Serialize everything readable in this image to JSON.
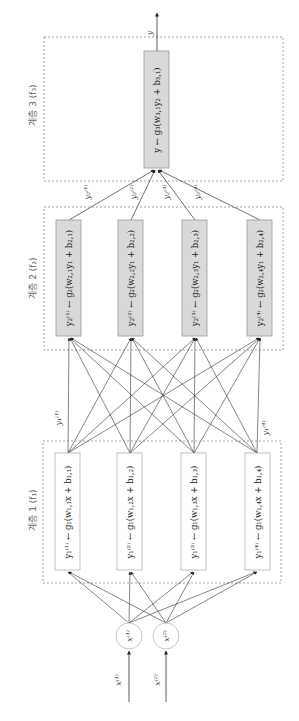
{
  "colors": {
    "background": "#ffffff",
    "layer_box_stroke": "#888888",
    "edge": "#333333",
    "layer1_node_fill": "#ffffff",
    "layer1_node_stroke": "#b0b0b0",
    "hidden_node_fill": "#d9d9d9",
    "hidden_node_stroke": "#999999",
    "input_circle_stroke": "#c8c8c8"
  },
  "output": {
    "label": "y"
  },
  "layers": [
    {
      "id": "layer3",
      "label": "계층 3 (f₃)",
      "nodes": [
        {
          "formula": "y ← g₃(w₃,₁y₂ + b₃,₁)"
        }
      ]
    },
    {
      "id": "layer2",
      "label": "계층 2 (f₂)",
      "nodes": [
        {
          "formula": "y₂⁽¹⁾ ← g₂(w₂,₁y₁ + b₂,₁)"
        },
        {
          "formula": "y₂⁽²⁾ ← g₂(w₂,₂y₁ + b₂,₂)"
        },
        {
          "formula": "y₂⁽³⁾ ← g₂(w₂,₃y₁ + b₂,₃)"
        },
        {
          "formula": "y₂⁽⁴⁾ ← g₂(w₂,₄y₁ + b₂,₄)"
        }
      ]
    },
    {
      "id": "layer1",
      "label": "계층 1 (f₁)",
      "nodes": [
        {
          "formula": "y₁⁽¹⁾ ← g₁(w₁,₁x + b₁,₁)"
        },
        {
          "formula": "y₁⁽²⁾ ← g₁(w₁,₂x + b₁,₂)"
        },
        {
          "formula": "y₁⁽³⁾ ← g₁(w₁,₃x + b₁,₃)"
        },
        {
          "formula": "y₁⁽⁴⁾ ← g₁(w₁,₄x + b₁,₄)"
        }
      ]
    }
  ],
  "edge_labels": {
    "layer2_to_layer3": [
      "y₂⁽¹⁾",
      "y₂⁽²⁾",
      "y₂⁽³⁾",
      "y₂⁽⁴⁾"
    ],
    "layer1_to_layer2": [
      "y₁⁽¹⁾",
      "y₁⁽⁴⁾"
    ]
  },
  "inputs": [
    {
      "node_label": "x⁽¹⁾",
      "arrow_label": "x⁽¹⁾"
    },
    {
      "node_label": "x⁽²⁾",
      "arrow_label": "x⁽²⁾"
    }
  ]
}
